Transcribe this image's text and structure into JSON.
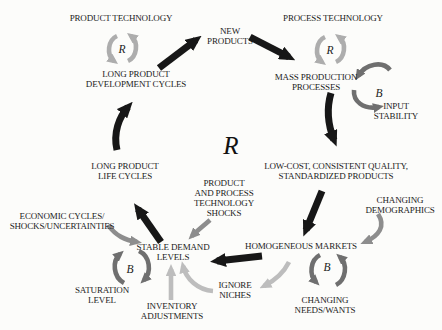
{
  "diagram": {
    "central_loop": {
      "label": "R"
    },
    "colors": {
      "background": "#fcfcfa",
      "main_chain_arrow": "#171717",
      "external_factor_arrow": "#8d8d8d",
      "light_feedback_arrow": "#bdbdbd",
      "reinforcing_loop_arc": "#adadad",
      "balancing_loop_arc": "#6f6f6f",
      "text": "#1b1b1b"
    },
    "nodes": [
      {
        "id": "product-technology",
        "lines": [
          "PRODUCT TECHNOLOGY"
        ]
      },
      {
        "id": "new-products",
        "lines": [
          "NEW",
          "PRODUCTS"
        ]
      },
      {
        "id": "process-technology",
        "lines": [
          "PROCESS TECHNOLOGY"
        ]
      },
      {
        "id": "long-product-development-cycles",
        "lines": [
          "LONG PRODUCT",
          "DEVELOPMENT CYCLES"
        ]
      },
      {
        "id": "mass-production-processes",
        "lines": [
          "MASS PRODUCTION",
          "PROCESSES"
        ]
      },
      {
        "id": "input-stability",
        "lines": [
          "INPUT",
          "STABILITY"
        ]
      },
      {
        "id": "low-cost-consistent-quality",
        "lines": [
          "LOW-COST, CONSISTENT QUALITY,",
          "STANDARDIZED PRODUCTS"
        ]
      },
      {
        "id": "long-product-life-cycles",
        "lines": [
          "LONG PRODUCT",
          "LIFE CYCLES"
        ]
      },
      {
        "id": "product-and-process-technology-shocks",
        "lines": [
          "PRODUCT",
          "AND PROCESS",
          "TECHNOLOGY",
          "SHOCKS"
        ]
      },
      {
        "id": "changing-demographics",
        "lines": [
          "CHANGING",
          "DEMOGRAPHICS"
        ]
      },
      {
        "id": "economic-cycles-shocks-uncertainties",
        "lines": [
          "ECONOMIC CYCLES/",
          "SHOCKS/UNCERTAINTIES"
        ]
      },
      {
        "id": "stable-demand-levels",
        "lines": [
          "STABLE DEMAND",
          "LEVELS"
        ]
      },
      {
        "id": "homogeneous-markets",
        "lines": [
          "HOMOGENEOUS MARKETS"
        ]
      },
      {
        "id": "saturation-level",
        "lines": [
          "SATURATION",
          "LEVEL"
        ]
      },
      {
        "id": "inventory-adjustments",
        "lines": [
          "INVENTORY",
          "ADJUSTMENTS"
        ]
      },
      {
        "id": "ignore-niches",
        "lines": [
          "IGNORE",
          "NICHES"
        ]
      },
      {
        "id": "changing-needs-wants",
        "lines": [
          "CHANGING",
          "NEEDS/WANTS"
        ]
      }
    ],
    "loops": [
      {
        "id": "product-technology-loop",
        "label": "R",
        "type": "reinforcing"
      },
      {
        "id": "process-technology-loop",
        "label": "R",
        "type": "reinforcing"
      },
      {
        "id": "input-stability-loop",
        "label": "B",
        "type": "balancing"
      },
      {
        "id": "saturation-level-loop",
        "label": "B",
        "type": "balancing"
      },
      {
        "id": "changing-needs-loop",
        "label": "B",
        "type": "balancing"
      }
    ],
    "arrows": [
      {
        "name": "dev-cycles-to-new-products",
        "from": "long-product-development-cycles",
        "to": "new-products",
        "style": "black"
      },
      {
        "name": "new-products-to-mass-production",
        "from": "new-products",
        "to": "mass-production-processes",
        "style": "black"
      },
      {
        "name": "mass-production-to-low-cost",
        "from": "mass-production-processes",
        "to": "low-cost-consistent-quality",
        "style": "black"
      },
      {
        "name": "low-cost-to-homogeneous-markets",
        "from": "low-cost-consistent-quality",
        "to": "homogeneous-markets",
        "style": "black"
      },
      {
        "name": "homogeneous-markets-to-stable-demand",
        "from": "homogeneous-markets",
        "to": "stable-demand-levels",
        "style": "black"
      },
      {
        "name": "stable-demand-to-long-life-cycles",
        "from": "stable-demand-levels",
        "to": "long-product-life-cycles",
        "style": "black"
      },
      {
        "name": "long-life-cycles-to-dev-cycles",
        "from": "long-product-life-cycles",
        "to": "long-product-development-cycles",
        "style": "black"
      },
      {
        "name": "changing-demographics-to-homogeneous-markets",
        "from": "changing-demographics",
        "to": "homogeneous-markets",
        "style": "gray"
      },
      {
        "name": "technology-shocks-to-stable-demand",
        "from": "product-and-process-technology-shocks",
        "to": "stable-demand-levels",
        "style": "gray"
      },
      {
        "name": "economic-cycles-to-stable-demand",
        "from": "economic-cycles-shocks-uncertainties",
        "to": "stable-demand-levels",
        "style": "gray"
      },
      {
        "name": "homogeneous-markets-to-ignore-niches",
        "from": "homogeneous-markets",
        "to": "ignore-niches",
        "style": "light-gray"
      },
      {
        "name": "ignore-niches-to-stable-demand",
        "from": "ignore-niches",
        "to": "stable-demand-levels",
        "style": "light-gray"
      },
      {
        "name": "inventory-adjustments-to-stable-demand",
        "from": "inventory-adjustments",
        "to": "stable-demand-levels",
        "style": "light-gray"
      }
    ]
  }
}
